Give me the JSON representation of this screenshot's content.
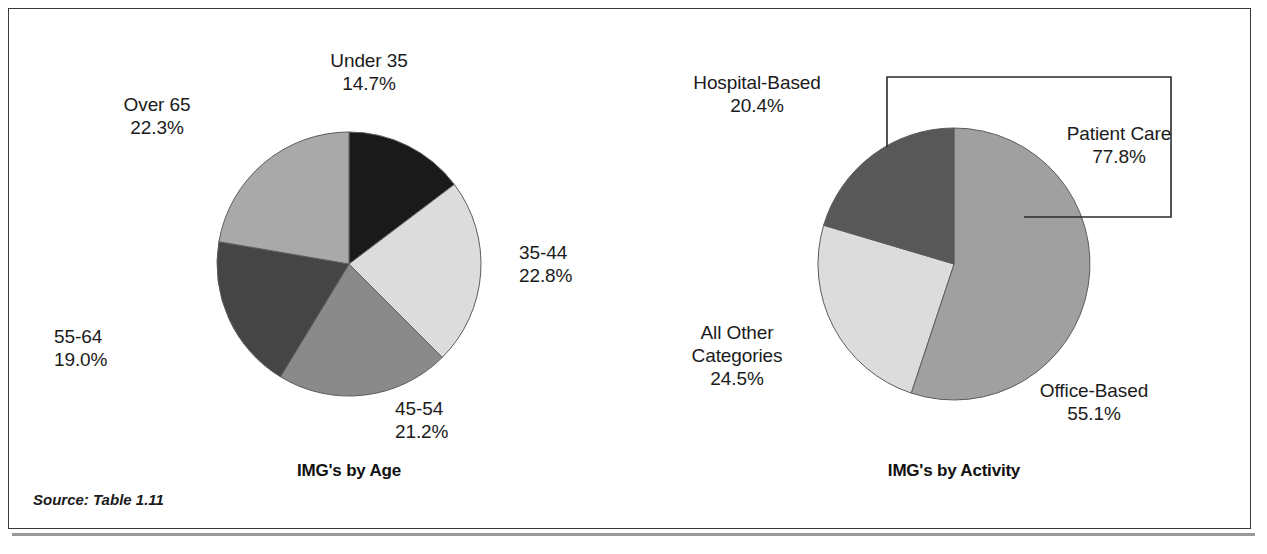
{
  "figure": {
    "source_note": "Source: Table 1.11",
    "border_color": "#3a3a3a",
    "background": "#ffffff"
  },
  "charts": [
    {
      "id": "img-by-age",
      "title": "IMG's by Age",
      "title_x": 340,
      "title_y": 452,
      "center": {
        "x": 340,
        "y": 255
      },
      "radius": 132,
      "start_angle": 0,
      "labels": [
        {
          "name": "under-35",
          "text": "Under 35",
          "pct": "14.7%",
          "x": 360,
          "y": 40,
          "align": "align-center"
        },
        {
          "name": "35-44",
          "text": "35-44",
          "pct": "22.8%",
          "x": 510,
          "y": 232,
          "align": "align-left"
        },
        {
          "name": "45-54",
          "text": "45-54",
          "pct": "21.2%",
          "x": 386,
          "y": 388,
          "align": "align-left"
        },
        {
          "name": "55-64",
          "text": "55-64",
          "pct": "19.0%",
          "x": 45,
          "y": 316,
          "align": "align-left"
        },
        {
          "name": "over-65",
          "text": "Over 65",
          "pct": "22.3%",
          "x": 148,
          "y": 84,
          "align": "align-center"
        }
      ]
    },
    {
      "id": "img-by-activity",
      "title": "IMG's by Activity",
      "title_x": 945,
      "title_y": 452,
      "center": {
        "x": 945,
        "y": 255
      },
      "radius": 136,
      "start_angle": 0,
      "labels": [
        {
          "name": "hospital-based",
          "text": "Hospital-Based",
          "pct": "20.4%",
          "x": 748,
          "y": 62,
          "align": "align-center"
        },
        {
          "name": "patient-care",
          "text": "Patient Care",
          "pct": "77.8%",
          "x": 1110,
          "y": 113,
          "align": "align-center"
        },
        {
          "name": "office-based",
          "text": "Office-Based",
          "pct": "55.1%",
          "x": 1085,
          "y": 370,
          "align": "align-center"
        },
        {
          "name": "all-other-categories",
          "text": "All Other\nCategories",
          "pct": "24.5%",
          "x": 728,
          "y": 312,
          "align": "align-center"
        }
      ],
      "bracket": {
        "name": "patient-care-bracket",
        "points": "878,138 878,68 1162,68 1162,208 1015,208",
        "color": "#2b2b2b"
      }
    }
  ],
  "chart_data": [
    {
      "type": "pie",
      "title": "IMG's by Age",
      "categories": [
        "Under 35",
        "35-44",
        "45-54",
        "55-64",
        "Over 65"
      ],
      "values": [
        14.7,
        22.8,
        21.2,
        19.0,
        22.3
      ],
      "value_labels": [
        "14.7%",
        "22.8%",
        "21.2%",
        "19.0%",
        "22.3%"
      ],
      "colors": [
        "#1a1a1a",
        "#dcdcdc",
        "#8a8a8a",
        "#454545",
        "#a9a9a9"
      ],
      "units": "percent",
      "legend": "none",
      "start_angle_deg": 0,
      "direction": "clockwise",
      "xlabel": "",
      "ylabel": ""
    },
    {
      "type": "pie",
      "title": "IMG's by Activity",
      "categories": [
        "Office-Based",
        "All Other Categories",
        "Hospital-Based"
      ],
      "values": [
        55.1,
        24.5,
        20.4
      ],
      "value_labels": [
        "55.1%",
        "24.5%",
        "20.4%"
      ],
      "colors": [
        "#a0a0a0",
        "#dcdcdc",
        "#585858"
      ],
      "units": "percent",
      "legend": "none",
      "start_angle_deg": 0,
      "direction": "clockwise",
      "annotations": [
        {
          "text": "Patient Care",
          "value": 77.8,
          "value_label": "77.8%",
          "covers": [
            "Hospital-Based",
            "Office-Based"
          ]
        }
      ],
      "xlabel": "",
      "ylabel": ""
    }
  ]
}
